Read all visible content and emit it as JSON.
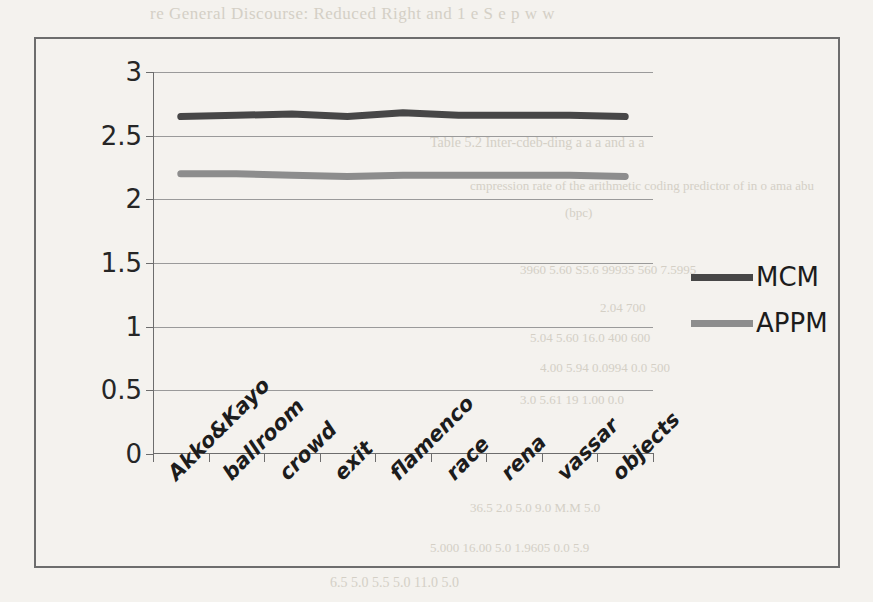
{
  "background_bleed": {
    "top_line": "re General Discourse:    Reduced Right and  1 e  S  e  p    w  w",
    "fragments": [
      "Table  5.2    Inter-cdeb-ding   a  a  a  and  a  a",
      "cmpression   rate   of   the   arithmetic   coding   predictor  of  in  o  ama  abu",
      "(bpc)",
      "3960          5.60      S5.6        99935        560      7.5995",
      "2.04                                              700",
      "5.04        5.60       16.0         400           600",
      "4.00        5.94      0.0994       0.0           500",
      "3.0         5.61        19          1.00          0.0",
      "36.5       2.0        5.0        9.0         M.M       5.0",
      "5.000      16.00       5.0      1.9605   0.0   5.9",
      "6.5     5.0      5.5      5.0     11.0     5.0"
    ]
  },
  "chart_data": {
    "type": "line",
    "title": "",
    "xlabel": "",
    "ylabel": "",
    "ylim": [
      0,
      3
    ],
    "yticks": [
      0,
      0.5,
      1,
      1.5,
      2,
      2.5,
      3
    ],
    "ytick_labels": [
      "0",
      "0.5",
      "1",
      "1.5",
      "2",
      "2.5",
      "3"
    ],
    "grid": true,
    "legend_position": "right",
    "categories": [
      "Akko&Kayo",
      "ballroom",
      "crowd",
      "exit",
      "flamenco",
      "race",
      "rena",
      "vassar",
      "objects"
    ],
    "series": [
      {
        "name": "MCM",
        "color": "#474747",
        "values": [
          2.65,
          2.66,
          2.67,
          2.65,
          2.68,
          2.66,
          2.66,
          2.66,
          2.65
        ]
      },
      {
        "name": "APPM",
        "color": "#8d8d8d",
        "values": [
          2.2,
          2.2,
          2.19,
          2.18,
          2.19,
          2.19,
          2.19,
          2.19,
          2.18
        ]
      }
    ]
  },
  "legend": {
    "items": [
      {
        "label": "MCM"
      },
      {
        "label": "APPM"
      }
    ]
  }
}
